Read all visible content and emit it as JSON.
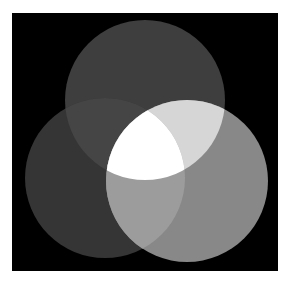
{
  "diagram": {
    "type": "venn",
    "set_count": 3,
    "background": {
      "x": 12,
      "y": 13,
      "width": 266,
      "height": 258,
      "color": "#000000"
    },
    "sets": [
      {
        "id": "top",
        "cx": 145,
        "cy": 100,
        "r": 80,
        "color": "#3e3e3e"
      },
      {
        "id": "left",
        "cx": 105,
        "cy": 178,
        "r": 80,
        "color": "#353535"
      },
      {
        "id": "right",
        "cx": 187,
        "cy": 181,
        "r": 81,
        "color": "#888888"
      }
    ],
    "intersections": {
      "top_left": "#454545",
      "top_right": "#d6d6d6",
      "left_right": "#9c9c9c",
      "all_three": "#ffffff"
    }
  }
}
